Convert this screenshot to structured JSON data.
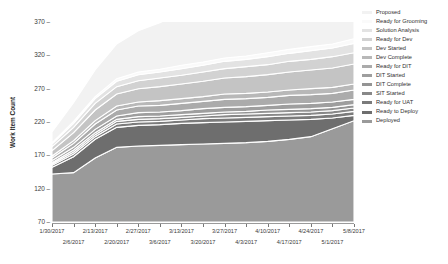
{
  "chart": {
    "ylabel": "Work Item Count",
    "ytick_labels": [
      "370",
      "320",
      "270",
      "220",
      "170",
      "120",
      "70"
    ],
    "xtick_labels_row0": [
      "1/30/2017",
      "2/13/2017",
      "2/27/2017",
      "3/13/2017",
      "3/27/2017",
      "4/10/2017",
      "4/24/2017",
      "5/8/2017"
    ],
    "xtick_labels_row1": [
      "2/6/2017",
      "2/20/2017",
      "3/6/2017",
      "3/20/2017",
      "4/3/2017",
      "4/17/2017",
      "5/1/2017"
    ]
  },
  "legend": {
    "items": [
      {
        "label": "Proposed",
        "color": "#f2f2f2"
      },
      {
        "label": "Ready for Grooming",
        "color": "#fafafa"
      },
      {
        "label": "Solution Analysis",
        "color": "#e3e3e3"
      },
      {
        "label": "Ready for Dev",
        "color": "#d2d2d2"
      },
      {
        "label": "Dev Started",
        "color": "#c4c4c4"
      },
      {
        "label": "Dev Complete",
        "color": "#b8b8b8"
      },
      {
        "label": "Ready for DIT",
        "color": "#ababab"
      },
      {
        "label": "DIT Started",
        "color": "#9e9e9e"
      },
      {
        "label": "DIT Complete",
        "color": "#949494"
      },
      {
        "label": "SIT Started",
        "color": "#888888"
      },
      {
        "label": "Ready for UAT",
        "color": "#7b7b7b"
      },
      {
        "label": "Ready to Deploy",
        "color": "#6e6e6e"
      },
      {
        "label": "Deployed",
        "color": "#9a9a9a"
      }
    ]
  },
  "chart_data": {
    "type": "area",
    "stacked": true,
    "title": "",
    "xlabel": "",
    "ylabel": "Work Item Count",
    "ylim": [
      70,
      370
    ],
    "yticks": [
      70,
      120,
      170,
      220,
      270,
      320,
      370
    ],
    "grid": false,
    "legend_position": "right",
    "x": [
      "1/30/2017",
      "2/6/2017",
      "2/13/2017",
      "2/20/2017",
      "2/27/2017",
      "3/6/2017",
      "3/13/2017",
      "3/20/2017",
      "3/27/2017",
      "4/3/2017",
      "4/10/2017",
      "4/17/2017",
      "4/24/2017",
      "5/1/2017",
      "5/8/2017"
    ],
    "series": [
      {
        "name": "Deployed",
        "values": [
          72,
          74,
          96,
          112,
          114,
          115,
          116,
          117,
          118,
          119,
          121,
          124,
          128,
          140,
          152
        ]
      },
      {
        "name": "Ready to Deploy",
        "values": [
          10,
          24,
          28,
          30,
          31,
          31,
          32,
          32,
          32,
          32,
          31,
          29,
          26,
          16,
          8
        ]
      },
      {
        "name": "Ready for UAT",
        "values": [
          3,
          4,
          4,
          5,
          5,
          5,
          5,
          6,
          6,
          6,
          6,
          6,
          6,
          6,
          6
        ]
      },
      {
        "name": "SIT Started",
        "values": [
          2,
          3,
          3,
          4,
          4,
          4,
          4,
          4,
          5,
          5,
          5,
          5,
          5,
          5,
          5
        ]
      },
      {
        "name": "DIT Complete",
        "values": [
          2,
          3,
          3,
          3,
          4,
          4,
          4,
          4,
          4,
          4,
          5,
          5,
          5,
          5,
          5
        ]
      },
      {
        "name": "DIT Started",
        "values": [
          3,
          4,
          5,
          5,
          6,
          6,
          6,
          7,
          7,
          7,
          7,
          8,
          8,
          8,
          8
        ]
      },
      {
        "name": "Ready for DIT",
        "values": [
          4,
          6,
          8,
          9,
          10,
          10,
          11,
          11,
          12,
          12,
          12,
          13,
          13,
          13,
          14
        ]
      },
      {
        "name": "Dev Complete",
        "values": [
          3,
          4,
          5,
          6,
          6,
          7,
          7,
          7,
          8,
          8,
          8,
          8,
          9,
          9,
          9
        ]
      },
      {
        "name": "Dev Started",
        "values": [
          8,
          12,
          16,
          18,
          20,
          21,
          22,
          23,
          24,
          25,
          26,
          27,
          28,
          29,
          30
        ]
      },
      {
        "name": "Ready for Dev",
        "values": [
          6,
          8,
          10,
          11,
          12,
          13,
          13,
          14,
          14,
          15,
          15,
          16,
          16,
          17,
          17
        ]
      },
      {
        "name": "Solution Analysis",
        "values": [
          4,
          6,
          7,
          8,
          9,
          9,
          10,
          10,
          11,
          11,
          12,
          12,
          13,
          13,
          14
        ]
      },
      {
        "name": "Ready for Grooming",
        "values": [
          2,
          3,
          3,
          4,
          4,
          4,
          5,
          5,
          5,
          5,
          6,
          6,
          6,
          6,
          7
        ]
      },
      {
        "name": "Proposed",
        "values": [
          16,
          28,
          40,
          52,
          62,
          70,
          78,
          86,
          100,
          106,
          118,
          126,
          132,
          140,
          150
        ]
      }
    ]
  }
}
